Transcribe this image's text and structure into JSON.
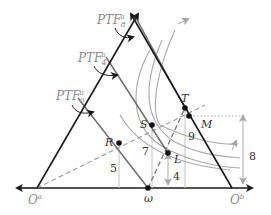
{
  "diagram": {
    "colors": {
      "axis": "#1a1a1a",
      "ptf_line": "#6e6e6e",
      "gray_curve": "#a8a8a8",
      "dashed": "#a0a0a0",
      "label_gray": "#8a8a8a",
      "label_dark": "#333333",
      "point": "#111111"
    },
    "labels": {
      "ptf8": {
        "base": "PTF",
        "sup": "a",
        "sub": "8"
      },
      "ptf4": {
        "base": "PTF",
        "sup": "a",
        "sub": "4"
      },
      "ptf0": {
        "base": "PTF",
        "sup": "a",
        "sub": "0"
      },
      "origin_a": {
        "base": "O",
        "sup": "a"
      },
      "origin_b": {
        "base": "O",
        "sup": "b"
      },
      "omega": "ω"
    },
    "points": {
      "T": "T",
      "S": "S",
      "R": "R",
      "L": "L",
      "M": "M"
    },
    "values": {
      "R_height": "5",
      "S_height": "7",
      "L_height": "4",
      "T_height": "9",
      "M_height": "8"
    }
  }
}
